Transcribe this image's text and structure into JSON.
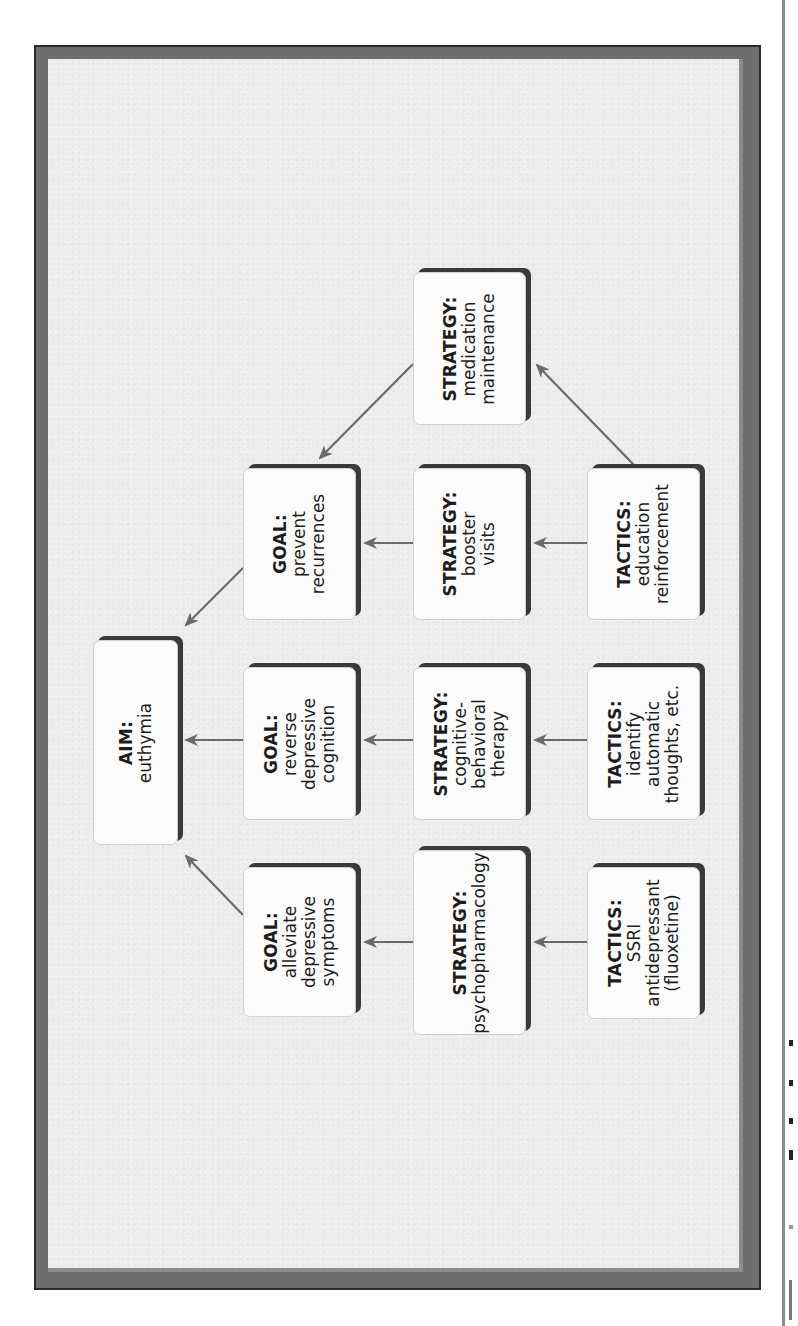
{
  "diagram": {
    "orientation": "rotated-90-ccw",
    "colors": {
      "frame_outer": "#6e6e6e",
      "frame_border": "#2a2a2a",
      "panel_background": "#ececec",
      "node_fill": "#fbfbfb",
      "node_shadow": "#3a3a3a",
      "arrow": "#6a6a6a",
      "text": "#1d1d1d"
    },
    "nodes": {
      "aim": {
        "kind": "AIM:",
        "lines": [
          "euthymia"
        ]
      },
      "goal_prevent": {
        "kind": "GOAL:",
        "lines": [
          "prevent",
          "recurrences"
        ]
      },
      "goal_reverse": {
        "kind": "GOAL:",
        "lines": [
          "reverse",
          "depressive",
          "cognition"
        ]
      },
      "goal_alleviate": {
        "kind": "GOAL:",
        "lines": [
          "alleviate",
          "depressive",
          "symptoms"
        ]
      },
      "strategy_medication": {
        "kind": "STRATEGY:",
        "lines": [
          "medication",
          "maintenance"
        ]
      },
      "strategy_booster": {
        "kind": "STRATEGY:",
        "lines": [
          "booster",
          "visits"
        ]
      },
      "strategy_cbt": {
        "kind": "STRATEGY:",
        "lines": [
          "cognitive-",
          "behavioral",
          "therapy"
        ]
      },
      "strategy_psycho": {
        "kind": "STRATEGY:",
        "lines": [
          "psychopharmacology"
        ]
      },
      "tactics_education": {
        "kind": "TACTICS:",
        "lines": [
          "education",
          "reinforcement"
        ]
      },
      "tactics_identify": {
        "kind": "TACTICS:",
        "lines": [
          "identify",
          "automatic",
          "thoughts, etc."
        ]
      },
      "tactics_ssri": {
        "kind": "TACTICS:",
        "lines": [
          "SSRI",
          "antidepressant",
          "(fluoxetine)"
        ]
      }
    },
    "edges": [
      {
        "from": "goal_prevent",
        "to": "aim"
      },
      {
        "from": "goal_reverse",
        "to": "aim"
      },
      {
        "from": "goal_alleviate",
        "to": "aim"
      },
      {
        "from": "strategy_medication",
        "to": "goal_prevent"
      },
      {
        "from": "strategy_booster",
        "to": "goal_prevent"
      },
      {
        "from": "strategy_cbt",
        "to": "goal_reverse"
      },
      {
        "from": "strategy_psycho",
        "to": "goal_alleviate"
      },
      {
        "from": "tactics_education",
        "to": "strategy_medication"
      },
      {
        "from": "tactics_education",
        "to": "strategy_booster"
      },
      {
        "from": "tactics_identify",
        "to": "strategy_cbt"
      },
      {
        "from": "tactics_ssri",
        "to": "strategy_psycho"
      }
    ]
  }
}
